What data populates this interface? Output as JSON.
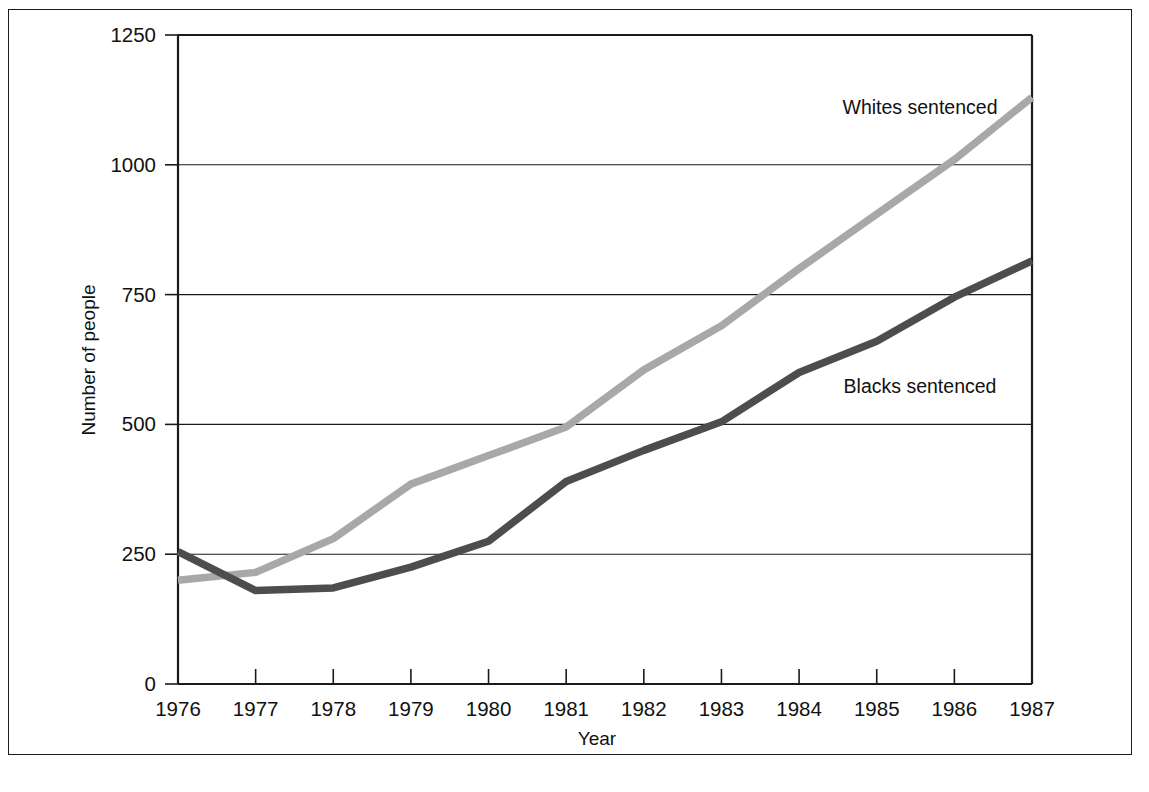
{
  "figure": {
    "background_color": "#ffffff",
    "border_color": "#1a1a1a"
  },
  "chart_data": {
    "type": "line",
    "title": "",
    "subtitle": "",
    "xlabel": "Year",
    "ylabel": "Number of people",
    "x": [
      1976,
      1977,
      1978,
      1979,
      1980,
      1981,
      1982,
      1983,
      1984,
      1985,
      1986,
      1987
    ],
    "xtick_labels": [
      "1976",
      "1977",
      "1978",
      "1979",
      "1980",
      "1981",
      "1982",
      "1983",
      "1984",
      "1985",
      "1986",
      "1987"
    ],
    "ytick_labels": [
      "0",
      "250",
      "500",
      "750",
      "1000",
      "1250"
    ],
    "ytick_values": [
      0,
      250,
      500,
      750,
      1000,
      1250
    ],
    "xlim": [
      1976,
      1987
    ],
    "ylim": [
      0,
      1250
    ],
    "grid": "horizontal",
    "legend_position": "inline-annotation",
    "series": [
      {
        "name": "Whites sentenced",
        "color": "#a8a8a8",
        "label_text": "Whites sentenced",
        "values": [
          200,
          215,
          280,
          385,
          440,
          495,
          605,
          690,
          800,
          905,
          1010,
          1130
        ]
      },
      {
        "name": "Blacks sentenced",
        "color": "#4d4d4d",
        "label_text": "Blacks sentenced",
        "values": [
          255,
          180,
          185,
          225,
          275,
          390,
          450,
          505,
          600,
          660,
          745,
          815
        ]
      }
    ],
    "annotations": [
      {
        "text": "Whites sentenced",
        "x_px": 920,
        "y_px": 114
      },
      {
        "text": "Blacks sentenced",
        "x_px": 920,
        "y_px": 393
      }
    ]
  }
}
